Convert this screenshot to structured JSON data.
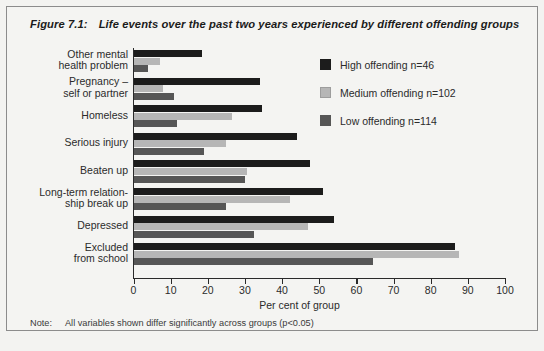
{
  "figure": {
    "number": "Figure 7.1:",
    "title": "Life events over the past two years experienced by different offending groups",
    "note_label": "Note:",
    "note_text": "All variables shown differ significantly across groups (p<0.05)"
  },
  "legend": {
    "position": "top-right",
    "entries": [
      {
        "key": "high",
        "label": "High offending n=46",
        "color": "#1c1c1c"
      },
      {
        "key": "medium",
        "label": "Medium offending n=102",
        "color": "#b6b6b6"
      },
      {
        "key": "low",
        "label": "Low offending n=114",
        "color": "#565656"
      }
    ]
  },
  "chart_data": {
    "type": "bar",
    "orientation": "horizontal",
    "title": "Life events over the past two years experienced by different offending groups",
    "xlabel": "Per cent of group",
    "ylabel": "",
    "xlim": [
      0,
      100
    ],
    "xticks": [
      0,
      10,
      20,
      30,
      40,
      50,
      60,
      70,
      80,
      90,
      100
    ],
    "xtick_labels": [
      "0",
      "10",
      "20",
      "30",
      "40",
      "50",
      "60",
      "70",
      "80",
      "90",
      "100"
    ],
    "grid": false,
    "legend_position": "upper right",
    "categories": [
      "Other mental health problem",
      "Pregnancy – self or partner",
      "Homeless",
      "Serious injury",
      "Beaten up",
      "Long-term relationship break up",
      "Depressed",
      "Excluded from school"
    ],
    "category_label_lines": [
      [
        "Other mental",
        "health problem"
      ],
      [
        "Pregnancy –",
        "self or partner"
      ],
      [
        "Homeless"
      ],
      [
        "Serious injury"
      ],
      [
        "Beaten up"
      ],
      [
        "Long-term relation-",
        "ship break up"
      ],
      [
        "Depressed"
      ],
      [
        "Excluded",
        "from school"
      ]
    ],
    "series": [
      {
        "name": "High offending n=46",
        "key": "high",
        "color": "#1c1c1c",
        "values": [
          18.5,
          34,
          34.5,
          44,
          47.5,
          51,
          54,
          86.5
        ]
      },
      {
        "name": "Medium offending n=102",
        "key": "medium",
        "color": "#b6b6b6",
        "values": [
          7,
          8,
          26.5,
          25,
          30.5,
          42,
          47,
          87.5
        ]
      },
      {
        "name": "Low offending n=114",
        "key": "low",
        "color": "#565656",
        "values": [
          4,
          11,
          11.7,
          19,
          30,
          25,
          32.5,
          64.5
        ]
      }
    ]
  }
}
